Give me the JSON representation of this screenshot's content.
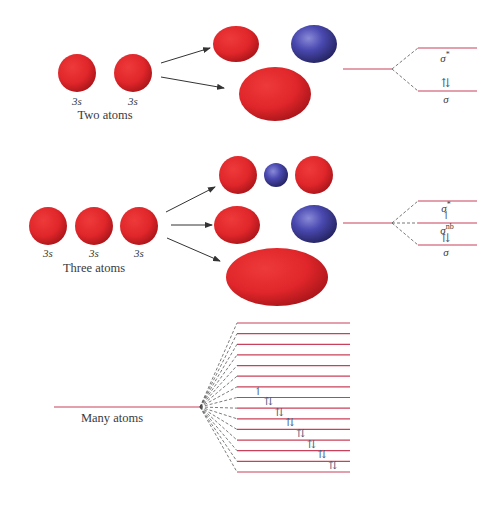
{
  "colors": {
    "bonding_red": "#e0262a",
    "antibonding_blue": "#3b3a9e",
    "energy_level": "#c8405a",
    "arrow": "#333333",
    "text": "#3a3a3a"
  },
  "two_atoms": {
    "caption": "Two atoms",
    "orbital_labels": [
      "3s",
      "3s"
    ],
    "levels": [
      {
        "label": "σ",
        "sup": "*",
        "electrons": ""
      },
      {
        "label": "σ",
        "sup": "",
        "electrons": "⇅"
      }
    ]
  },
  "three_atoms": {
    "caption": "Three atoms",
    "orbital_labels": [
      "3s",
      "3s",
      "3s"
    ],
    "levels": [
      {
        "label": "σ",
        "sup": "*",
        "electrons": ""
      },
      {
        "label": "σ",
        "sup": "nb",
        "electrons": "↿"
      },
      {
        "label": "σ",
        "sup": "",
        "electrons": "⇅"
      }
    ]
  },
  "many_atoms": {
    "caption": "Many atoms",
    "level_count": 15,
    "electrons": [
      "",
      "",
      "",
      "",
      "",
      "",
      "",
      "↿",
      "⇅",
      "⇅",
      "⇅",
      "⇅",
      "⇅",
      "⇅",
      "⇅"
    ]
  }
}
